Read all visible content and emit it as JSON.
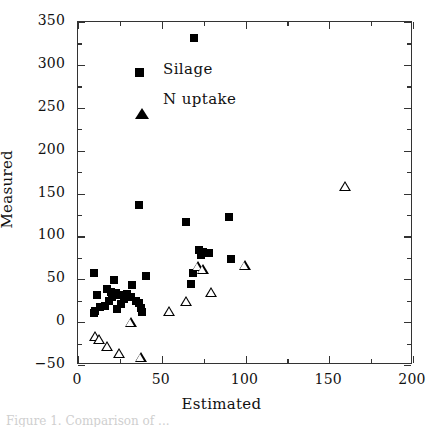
{
  "chart_data": {
    "type": "scatter",
    "title": "",
    "xlabel": "Estimated",
    "ylabel": "Measured",
    "xlim": [
      0,
      200
    ],
    "ylim": [
      -50,
      350
    ],
    "xticks": [
      0,
      50,
      100,
      150,
      200
    ],
    "xtick_labels": [
      "0",
      "50",
      "100",
      "150",
      "200"
    ],
    "xminor_ticks": [
      25,
      75,
      125,
      175
    ],
    "yticks": [
      -50,
      0,
      50,
      100,
      150,
      200,
      250,
      300,
      350
    ],
    "ytick_labels": [
      "−50",
      "0",
      "50",
      "100",
      "150",
      "200",
      "250",
      "300",
      "350"
    ],
    "grid": false,
    "legend_position": "upper-left-inside",
    "series": [
      {
        "name": "Silage",
        "marker": "filled-square",
        "color": "#000000",
        "points": [
          [
            70,
            330
          ],
          [
            37,
            135
          ],
          [
            65,
            116
          ],
          [
            91,
            121
          ],
          [
            10,
            56
          ],
          [
            41,
            53
          ],
          [
            69,
            56
          ],
          [
            22,
            48
          ],
          [
            33,
            42
          ],
          [
            12,
            31
          ],
          [
            18,
            38
          ],
          [
            20,
            34
          ],
          [
            21,
            28
          ],
          [
            23,
            33
          ],
          [
            25,
            30
          ],
          [
            30,
            32
          ],
          [
            32,
            28
          ],
          [
            35,
            24
          ],
          [
            37,
            21
          ],
          [
            38,
            15
          ],
          [
            39,
            11
          ],
          [
            19,
            24
          ],
          [
            17,
            18
          ],
          [
            14,
            16
          ],
          [
            11,
            12
          ],
          [
            10,
            9
          ],
          [
            24,
            14
          ],
          [
            26,
            20
          ],
          [
            28,
            26
          ],
          [
            68,
            43
          ],
          [
            73,
            83
          ],
          [
            75,
            81
          ],
          [
            77,
            79
          ],
          [
            79,
            80
          ],
          [
            74,
            77
          ],
          [
            92,
            72
          ]
        ]
      },
      {
        "name": "N uptake",
        "marker": "open-triangle",
        "color": "#000000",
        "points": [
          [
            160,
            156
          ],
          [
            100,
            69
          ],
          [
            72,
            73
          ],
          [
            75,
            74
          ],
          [
            80,
            52
          ],
          [
            65,
            46
          ],
          [
            55,
            39
          ],
          [
            32,
            30
          ],
          [
            11,
            19
          ],
          [
            13,
            20
          ],
          [
            18,
            17
          ],
          [
            25,
            13
          ],
          [
            38,
            13
          ]
        ]
      }
    ]
  },
  "legend": {
    "items": [
      {
        "label": "Silage",
        "marker": "filled-square"
      },
      {
        "label": "N uptake",
        "marker": "open-triangle"
      }
    ]
  },
  "caption": "Figure 1. Comparison of ..."
}
